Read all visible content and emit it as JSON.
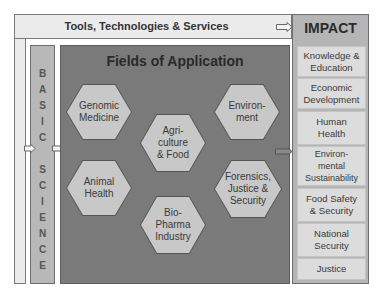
{
  "tools_bar": {
    "label": "Tools, Technologies & Services"
  },
  "basic_science": {
    "letters": [
      "B",
      "A",
      "S",
      "I",
      "C",
      "",
      "S",
      "C",
      "I",
      "E",
      "N",
      "C",
      "E"
    ]
  },
  "fields": {
    "title": "Fields of Application",
    "hexagons": [
      {
        "label": "Genomic\nMedicine"
      },
      {
        "label": "Environ-\nment"
      },
      {
        "label": "Agri-\nculture\n& Food"
      },
      {
        "label": "Animal\nHealth"
      },
      {
        "label": "Forensics,\nJustice &\nSecurity"
      },
      {
        "label": "Bio-\nPharma\nIndustry"
      }
    ]
  },
  "impact": {
    "title": "IMPACT",
    "items": [
      {
        "label": "Knowledge &\nEducation"
      },
      {
        "label": "Economic\nDevelopment"
      },
      {
        "label": "Human\nHealth"
      },
      {
        "label": "Environ-\nmental\nSustainability"
      },
      {
        "label": "Food Safety\n& Security"
      },
      {
        "label": "National\nSecurity"
      },
      {
        "label": "Justice"
      }
    ]
  },
  "colors": {
    "fields_bg": "#7a7a7a",
    "hex_fill": "#c8c8c8",
    "impact_bg": "#b5b5b5",
    "impact_item": "#dcdcdc",
    "basic_bg": "#b8b8b8",
    "tools_bg": "#ebebeb"
  }
}
